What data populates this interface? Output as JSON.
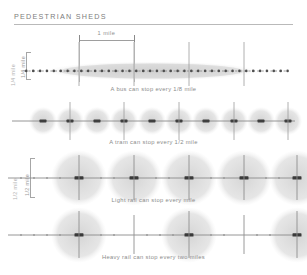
{
  "figure": {
    "title": "PEDESTRIAN SHEDS",
    "background_color": "#ffffff",
    "ink_color": "#8b8b8b",
    "shed_fill_color": "#d9d9d9",
    "axis_color": "#8a8a8a"
  },
  "scale": {
    "top_dimension_label": "1 mile",
    "top_dimension_miles": 1,
    "pixels_per_mile": 55
  },
  "radius_dimensions": [
    {
      "label": "1/4 mile",
      "applies_to": "bus"
    },
    {
      "label": "1/2 mile",
      "applies_to": "light rail"
    }
  ],
  "rows": [
    {
      "id": "bus",
      "mode": "bus",
      "caption": "A bus can stop every 1/8 mile",
      "stop_spacing_miles": 0.125,
      "shed_radius_miles": 0.125,
      "stop_count": 23,
      "marker_style": "small-dot",
      "shed_style": "soft-band"
    },
    {
      "id": "tram",
      "mode": "tram",
      "caption": "A tram can stop every 1/2 mile",
      "stop_spacing_miles": 0.5,
      "shed_radius_miles": 0.25,
      "stop_count": 10,
      "marker_style": "dash",
      "shed_style": "circle"
    },
    {
      "id": "light-rail",
      "mode": "light rail",
      "caption": "Light rail can stop every mile",
      "stop_spacing_miles": 1,
      "shed_radius_miles": 0.5,
      "stop_count": 5,
      "marker_style": "dash",
      "shed_style": "circle"
    },
    {
      "id": "heavy-rail",
      "mode": "heavy rail",
      "caption": "Heavy rail can stop every two miles",
      "stop_spacing_miles": 2,
      "shed_radius_miles": 0.5,
      "stop_count": 3,
      "marker_style": "dash",
      "shed_style": "circle"
    }
  ]
}
